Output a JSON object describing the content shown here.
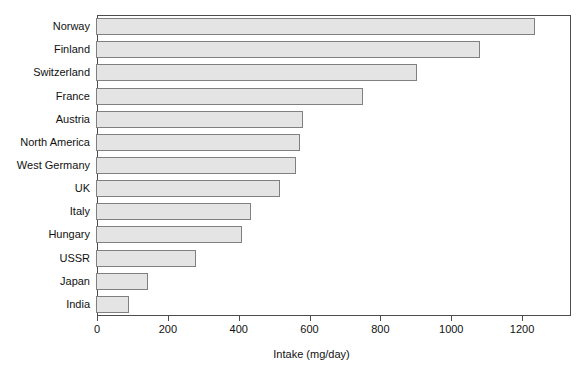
{
  "chart_data": {
    "type": "bar",
    "orientation": "horizontal",
    "title": "",
    "xlabel": "Intake (mg/day)",
    "ylabel": "",
    "xlim": [
      0,
      1338
    ],
    "xticks": [
      0,
      200,
      400,
      600,
      800,
      1000,
      1200
    ],
    "xticklabels": [
      "0",
      "200",
      "400",
      "600",
      "800",
      "1000",
      "1200"
    ],
    "grid": false,
    "legend": null,
    "categories": [
      "Norway",
      "Finland",
      "Switzerland",
      "France",
      "Austria",
      "North America",
      "West Germany",
      "UK",
      "Italy",
      "Hungary",
      "USSR",
      "Japan",
      "India"
    ],
    "values": [
      1240,
      1085,
      905,
      755,
      585,
      575,
      565,
      520,
      438,
      412,
      282,
      147,
      93
    ],
    "bar_fill_color": "#e4e4e4",
    "bar_edge_color": "#808080",
    "frame_color": "#4d4d4d"
  }
}
